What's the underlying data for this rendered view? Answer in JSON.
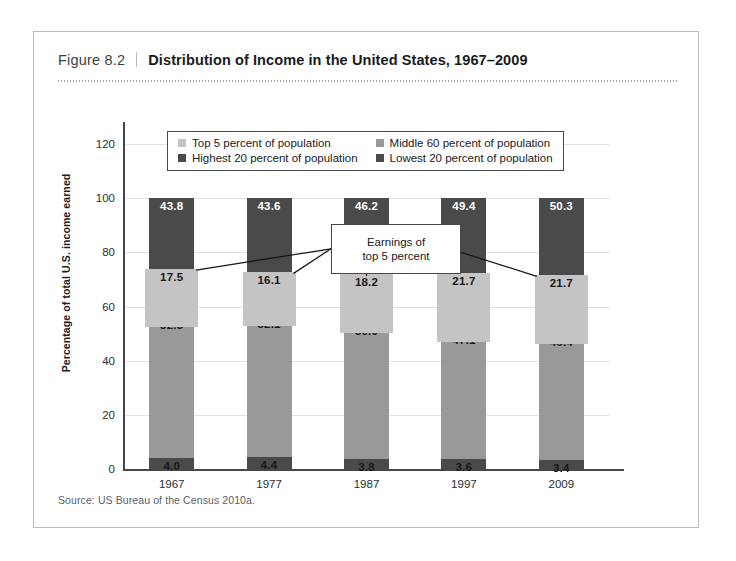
{
  "figure": {
    "number": "Figure 8.2",
    "title": "Distribution of Income in the United States, 1967–2009",
    "source": "Source: US Bureau of the Census 2010a."
  },
  "callout": {
    "line1": "Earnings of",
    "line2": "top 5 percent"
  },
  "colors": {
    "dark": "#4a4a4a",
    "medium": "#999999",
    "light": "#c4c4c4",
    "axis": "#45494c",
    "grid": "#dfe1e2",
    "card_border": "#b9bcbe"
  },
  "chart_data": {
    "type": "bar",
    "subtype": "stacked-bar-with-overlay",
    "title": "Distribution of Income in the United States, 1967–2009",
    "xlabel": "",
    "ylabel": "Percentage of total U.S. income earned",
    "ylim": [
      0,
      120
    ],
    "yticks": [
      0,
      20,
      40,
      60,
      80,
      100,
      120
    ],
    "grid": true,
    "legend_position": "top-center",
    "categories": [
      "1967",
      "1977",
      "1987",
      "1997",
      "2009"
    ],
    "series": [
      {
        "name": "Lowest 20 percent of population",
        "color": "#4a4a4a",
        "values": [
          4.0,
          4.4,
          3.8,
          3.6,
          3.4
        ],
        "labels": [
          "4.0",
          "4.4",
          "3.8",
          "3.6",
          "3.4"
        ]
      },
      {
        "name": "Middle 60 percent of population",
        "color": "#999999",
        "values": [
          52.3,
          52.1,
          50.0,
          47.1,
          46.4
        ],
        "labels": [
          "52.3",
          "52.1",
          "50.0",
          "47.1",
          "46.4"
        ]
      },
      {
        "name": "Highest 20 percent of population",
        "color": "#4a4a4a",
        "values": [
          43.8,
          43.6,
          46.2,
          49.4,
          50.3
        ],
        "labels": [
          "43.8",
          "43.6",
          "46.2",
          "49.4",
          "50.3"
        ]
      },
      {
        "name": "Top 5 percent of population",
        "color": "#c4c4c4",
        "overlay": true,
        "values": [
          17.5,
          16.1,
          18.2,
          21.7,
          21.7
        ],
        "labels": [
          "17.5",
          "16.1",
          "18.2",
          "21.7",
          "21.7"
        ]
      }
    ],
    "annotations": [
      {
        "text": "Earnings of top 5 percent",
        "points_to": "Top 5 percent of population"
      }
    ]
  },
  "legend": {
    "items": [
      {
        "label": "Top 5 percent of population",
        "color": "#c4c4c4"
      },
      {
        "label": "Middle 60 percent of population",
        "color": "#999999"
      },
      {
        "label": "Highest 20 percent of population",
        "color": "#4a4a4a"
      },
      {
        "label": "Lowest 20 percent of population",
        "color": "#4a4a4a"
      }
    ]
  },
  "axis": {
    "y_label": "Percentage of total U.S. income earned",
    "y_ticks": [
      "120",
      "100",
      "80",
      "60",
      "40",
      "20",
      "0"
    ],
    "x_ticks": [
      "1967",
      "1977",
      "1987",
      "1997",
      "2009"
    ]
  }
}
